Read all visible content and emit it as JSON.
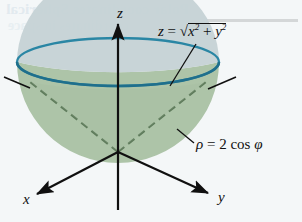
{
  "figure": {
    "kind": "3d-math-diagram",
    "background_color": "#f4f7f8"
  },
  "axes": {
    "z_label": "z",
    "x_label": "x",
    "y_label": "y",
    "color": "#101010"
  },
  "annotations": {
    "cone": {
      "lhs": "z",
      "equals": "=",
      "radicand_base_x": "x",
      "radicand_exp_x": "2",
      "plus": "+",
      "radicand_base_y": "y",
      "radicand_exp_y": "2",
      "full_text": "z = √(x² + y²)"
    },
    "sphere": {
      "lhs": "ρ",
      "equals": "=",
      "coefficient": "2",
      "function": "cos",
      "argument": "φ",
      "full_text": "ρ = 2 cos φ"
    }
  },
  "bleed_through": {
    "line1": "Polar coordinates Spherical",
    "line2": "coordinates in space"
  },
  "colors": {
    "rim_stroke": "#2a86a4",
    "bowl_interior": "#c6d3d6",
    "bowl_exterior_green": "#a6bfa0",
    "cone_dash": "#5d7a5a",
    "axis_dash_gray": "#8e9a98",
    "paper": "#f4f7f8",
    "ink": "#101010"
  }
}
